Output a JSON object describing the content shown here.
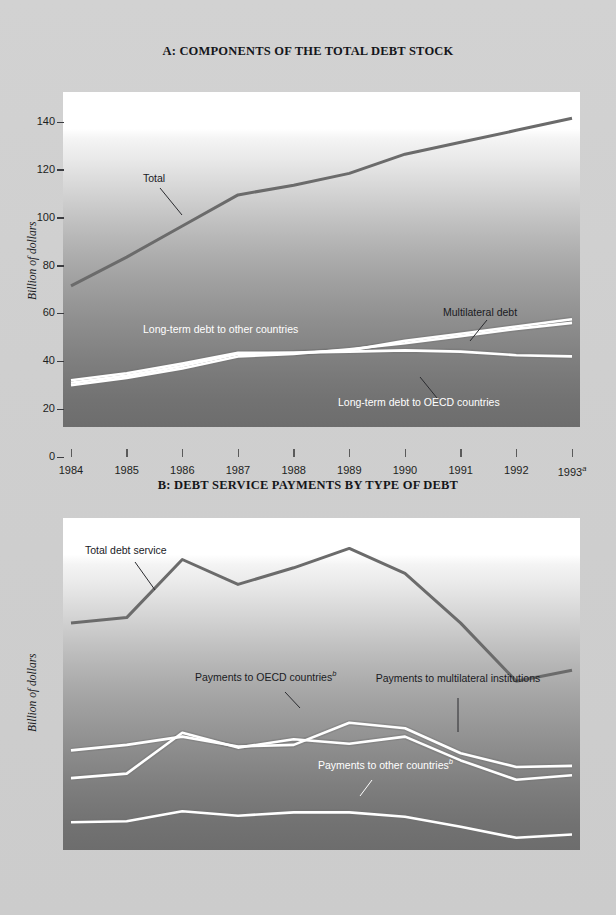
{
  "page": {
    "background_color": "#cfcfcf",
    "panels": [
      "A",
      "B"
    ]
  },
  "panel_a": {
    "title": "A: COMPONENTS OF THE TOTAL DEBT STOCK",
    "ylabel": "Billion of dollars",
    "yticks": [
      "0",
      "20",
      "40",
      "60",
      "80",
      "100",
      "120",
      "140"
    ],
    "xticks": [
      "1984",
      "1985",
      "1986",
      "1987",
      "1988",
      "1989",
      "1990",
      "1991",
      "1992",
      "1993"
    ],
    "last_tick_superscript": "a",
    "series_labels": {
      "total": "Total",
      "other_countries": "Long-term debt to other countries",
      "multilateral": "Multilateral debt",
      "oecd": "Long-term debt to OECD countries"
    }
  },
  "panel_b": {
    "title": "B: DEBT SERVICE PAYMENTS BY TYPE OF DEBT",
    "ylabel": "Billion of dollars",
    "yticks": [
      "0",
      "1",
      "2",
      "3",
      "4",
      "5",
      "6"
    ],
    "xticks": [
      "1984",
      "1985",
      "1986",
      "1987",
      "1988",
      "1989",
      "1990",
      "1991",
      "1992",
      "1993"
    ],
    "last_tick_superscript": "a",
    "series_labels": {
      "total": "Total debt service",
      "oecd": "Payments to OECD countries",
      "oecd_superscript": "b",
      "multilateral": "Payments to multilateral institutions",
      "other": "Payments to other countries",
      "other_superscript": "b"
    }
  },
  "chart_data": [
    {
      "type": "line",
      "id": "panel-a",
      "title": "A: COMPONENTS OF THE TOTAL DEBT STOCK",
      "xlabel": "",
      "ylabel": "Billion of dollars",
      "categories": [
        "1984",
        "1985",
        "1986",
        "1987",
        "1988",
        "1989",
        "1990",
        "1991",
        "1992",
        "1993"
      ],
      "ylim": [
        0,
        140
      ],
      "ytick_step": 20,
      "grid": false,
      "legend": "inline-annotations",
      "series": [
        {
          "name": "Total",
          "color": "#6b6b6b",
          "values": [
            59,
            71,
            84,
            97,
            101,
            106,
            114,
            119,
            124,
            129
          ]
        },
        {
          "name": "Long-term debt to other countries",
          "color": "#ffffff",
          "values": [
            18.5,
            21.5,
            25.5,
            30.5,
            31,
            32,
            36,
            39,
            42,
            45
          ]
        },
        {
          "name": "Multilateral debt",
          "color": "#ffffff",
          "values": [
            17.5,
            20.5,
            24.5,
            29.5,
            30.5,
            32.5,
            35,
            38,
            41,
            43.5
          ]
        },
        {
          "name": "Long-term debt to OECD countries",
          "color": "#ffffff",
          "values": [
            19.5,
            22.5,
            26.5,
            31,
            31,
            31.5,
            32,
            31.5,
            30,
            29.5
          ]
        }
      ]
    },
    {
      "type": "line",
      "id": "panel-b",
      "title": "B: DEBT SERVICE PAYMENTS BY TYPE OF DEBT",
      "xlabel": "",
      "ylabel": "Billion of dollars",
      "categories": [
        "1984",
        "1985",
        "1986",
        "1987",
        "1988",
        "1989",
        "1990",
        "1991",
        "1992",
        "1993"
      ],
      "ylim": [
        0,
        6
      ],
      "ytick_step": 1,
      "grid": false,
      "legend": "inline-annotations",
      "series": [
        {
          "name": "Total debt service",
          "color": "#6b6b6b",
          "values": [
            4.1,
            4.2,
            5.25,
            4.8,
            5.1,
            5.45,
            5.0,
            4.1,
            3.05,
            3.25
          ]
        },
        {
          "name": "Payments to OECD countries",
          "color": "#ffffff",
          "values": [
            1.8,
            1.9,
            2.05,
            1.87,
            1.9,
            2.3,
            2.2,
            1.75,
            1.5,
            1.52
          ]
        },
        {
          "name": "Payments to multilateral institutions",
          "color": "#ffffff",
          "values": [
            1.3,
            1.38,
            2.12,
            1.85,
            2.0,
            1.92,
            2.05,
            1.62,
            1.27,
            1.35
          ]
        },
        {
          "name": "Payments to other countries",
          "color": "#ffffff",
          "values": [
            0.5,
            0.52,
            0.7,
            0.62,
            0.68,
            0.68,
            0.6,
            0.42,
            0.22,
            0.28
          ]
        }
      ]
    }
  ]
}
